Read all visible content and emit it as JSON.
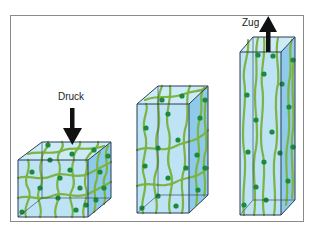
{
  "figure": {
    "labels": {
      "compression": "Druck",
      "tension": "Zug"
    },
    "colors": {
      "frame": "#8a8a8a",
      "front_face": "#b6e0f3",
      "side_face": "#8ecbea",
      "top_face": "#cdebf7",
      "edge": "#2b3a55",
      "strand": "#7cb342",
      "crosslink_node": "#1b8a3a",
      "arrow": "#111111"
    },
    "blocks": [
      {
        "name": "compressed",
        "state": "Druck"
      },
      {
        "name": "relaxed",
        "state": ""
      },
      {
        "name": "stretched",
        "state": "Zug"
      }
    ]
  }
}
